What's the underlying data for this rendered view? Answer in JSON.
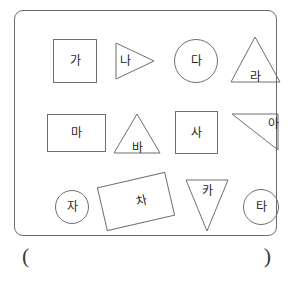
{
  "worksheet": {
    "shape_box": {
      "shapes": [
        {
          "label": "가",
          "shape_type": "square",
          "row": 1,
          "col": 1
        },
        {
          "label": "나",
          "shape_type": "triangle-right",
          "row": 1,
          "col": 2
        },
        {
          "label": "다",
          "shape_type": "circle",
          "row": 1,
          "col": 3
        },
        {
          "label": "라",
          "shape_type": "triangle-up",
          "row": 1,
          "col": 4
        },
        {
          "label": "마",
          "shape_type": "rectangle",
          "row": 2,
          "col": 1
        },
        {
          "label": "바",
          "shape_type": "triangle-up",
          "row": 2,
          "col": 2
        },
        {
          "label": "사",
          "shape_type": "square",
          "row": 2,
          "col": 3
        },
        {
          "label": "아",
          "shape_type": "triangle-right-angle",
          "row": 2,
          "col": 4
        },
        {
          "label": "자",
          "shape_type": "circle",
          "row": 3,
          "col": 1
        },
        {
          "label": "차",
          "shape_type": "rectangle-rotated",
          "row": 3,
          "col": 2
        },
        {
          "label": "카",
          "shape_type": "triangle-down",
          "row": 3,
          "col": 3
        },
        {
          "label": "타",
          "shape_type": "circle",
          "row": 3,
          "col": 4
        }
      ]
    },
    "answer": {
      "paren_open": "(",
      "paren_close": ")",
      "value": ""
    },
    "colors": {
      "box_border": "#6b6b6b",
      "shape_stroke": "#6f6f6f",
      "text": "#1f1f1f",
      "background": "#ffffff"
    }
  }
}
